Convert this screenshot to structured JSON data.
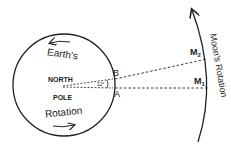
{
  "diagram": {
    "earth": {
      "top_label": "Earth's",
      "bottom_label": "Rotation",
      "center_label_line1": "NORTH",
      "center_label_line2": "POLE",
      "angle_label": "12°"
    },
    "points": {
      "a": "A",
      "b": "B",
      "m1": "M",
      "m1_sub": "1",
      "m2": "M",
      "m2_sub": "2"
    },
    "moon_orbit_label": "Moon's Rotation",
    "colors": {
      "stroke": "#222222",
      "background": "#ffffff"
    }
  }
}
